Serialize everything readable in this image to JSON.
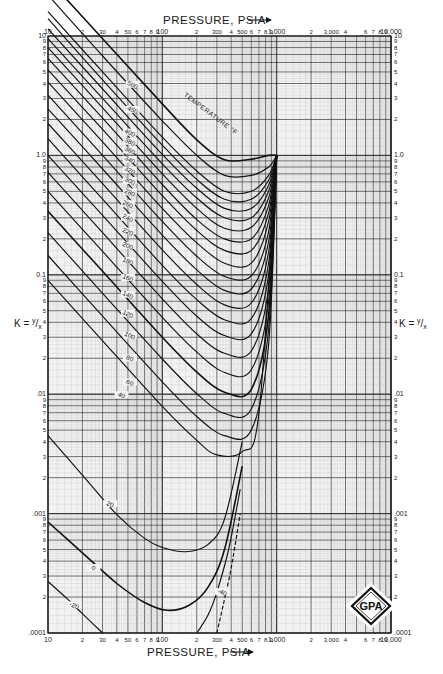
{
  "chart_data": {
    "type": "line",
    "title": "",
    "xlabel": "PRESSURE, PSIA",
    "ylabel": "K = y/x",
    "xscale": "log",
    "yscale": "log",
    "xlim": [
      10,
      10000
    ],
    "ylim": [
      0.0001,
      10
    ],
    "grid": true,
    "legend": "inline curve labels",
    "annotation": "TEMPERATURE °F",
    "logo": "GPA",
    "x_ticks_major": [
      "10",
      "100",
      "1,000",
      "10,000"
    ],
    "x_ticks_labeled": [
      {
        "v": 10,
        "t": "10"
      },
      {
        "v": 20,
        "t": "2"
      },
      {
        "v": 30,
        "t": "30"
      },
      {
        "v": 40,
        "t": "4"
      },
      {
        "v": 50,
        "t": "50"
      },
      {
        "v": 60,
        "t": "6"
      },
      {
        "v": 70,
        "t": "7"
      },
      {
        "v": 80,
        "t": "8"
      },
      {
        "v": 90,
        "t": "9"
      },
      {
        "v": 100,
        "t": "100"
      },
      {
        "v": 200,
        "t": "2"
      },
      {
        "v": 300,
        "t": "300"
      },
      {
        "v": 400,
        "t": "4"
      },
      {
        "v": 500,
        "t": "500"
      },
      {
        "v": 600,
        "t": "6"
      },
      {
        "v": 700,
        "t": "7"
      },
      {
        "v": 800,
        "t": "8"
      },
      {
        "v": 900,
        "t": "9"
      },
      {
        "v": 1000,
        "t": "1,000"
      },
      {
        "v": 2000,
        "t": "2"
      },
      {
        "v": 3000,
        "t": "3,000"
      },
      {
        "v": 4000,
        "t": "4"
      },
      {
        "v": 6000,
        "t": "6"
      },
      {
        "v": 7000,
        "t": "7"
      },
      {
        "v": 8000,
        "t": "8"
      },
      {
        "v": 9000,
        "t": "9"
      },
      {
        "v": 10000,
        "t": "10,000"
      }
    ],
    "y_ticks_labeled": [
      {
        "v": 10,
        "t": "10"
      },
      {
        "v": 1,
        "t": "1.0"
      },
      {
        "v": 0.1,
        "t": "0.1"
      },
      {
        "v": 0.01,
        "t": ".01"
      },
      {
        "v": 0.001,
        "t": ".001"
      },
      {
        "v": 0.0001,
        "t": ".0001"
      }
    ],
    "convergence_pressure_psia": 1000,
    "series": [
      {
        "name": "500",
        "points": [
          [
            10,
            30
          ],
          [
            30,
            9.5
          ],
          [
            100,
            2.7
          ],
          [
            200,
            1.35
          ],
          [
            350,
            0.92
          ],
          [
            600,
            0.93
          ],
          [
            850,
            1.0
          ],
          [
            1000,
            1.0
          ]
        ]
      },
      {
        "name": "450",
        "points": [
          [
            10,
            22
          ],
          [
            30,
            6.8
          ],
          [
            100,
            1.95
          ],
          [
            200,
            1.0
          ],
          [
            350,
            0.68
          ],
          [
            600,
            0.68
          ],
          [
            850,
            0.8
          ],
          [
            1000,
            1.0
          ]
        ]
      },
      {
        "name": "400",
        "points": [
          [
            10,
            16
          ],
          [
            30,
            5.0
          ],
          [
            100,
            1.42
          ],
          [
            200,
            0.74
          ],
          [
            350,
            0.5
          ],
          [
            600,
            0.5
          ],
          [
            850,
            0.68
          ],
          [
            1000,
            1.0
          ]
        ]
      },
      {
        "name": "380",
        "points": [
          [
            10,
            14
          ],
          [
            30,
            4.3
          ],
          [
            100,
            1.22
          ],
          [
            200,
            0.63
          ],
          [
            350,
            0.43
          ],
          [
            600,
            0.43
          ],
          [
            850,
            0.62
          ],
          [
            1000,
            1.0
          ]
        ]
      },
      {
        "name": "360",
        "points": [
          [
            10,
            11.5
          ],
          [
            30,
            3.6
          ],
          [
            100,
            1.02
          ],
          [
            200,
            0.53
          ],
          [
            350,
            0.36
          ],
          [
            600,
            0.36
          ],
          [
            850,
            0.56
          ],
          [
            1000,
            1.0
          ]
        ]
      },
      {
        "name": "340",
        "points": [
          [
            10,
            9.5
          ],
          [
            30,
            3.0
          ],
          [
            100,
            0.85
          ],
          [
            200,
            0.44
          ],
          [
            350,
            0.3
          ],
          [
            600,
            0.3
          ],
          [
            850,
            0.5
          ],
          [
            1000,
            1.0
          ]
        ]
      },
      {
        "name": "320",
        "points": [
          [
            10,
            8.0
          ],
          [
            30,
            2.5
          ],
          [
            100,
            0.7
          ],
          [
            200,
            0.36
          ],
          [
            350,
            0.245
          ],
          [
            600,
            0.25
          ],
          [
            850,
            0.44
          ],
          [
            1000,
            1.0
          ]
        ]
      },
      {
        "name": "300",
        "points": [
          [
            10,
            6.5
          ],
          [
            30,
            2.05
          ],
          [
            100,
            0.57
          ],
          [
            200,
            0.29
          ],
          [
            350,
            0.2
          ],
          [
            600,
            0.2
          ],
          [
            850,
            0.38
          ],
          [
            1000,
            1.0
          ]
        ]
      },
      {
        "name": "280",
        "points": [
          [
            10,
            5.2
          ],
          [
            30,
            1.65
          ],
          [
            100,
            0.46
          ],
          [
            200,
            0.235
          ],
          [
            350,
            0.16
          ],
          [
            600,
            0.16
          ],
          [
            850,
            0.33
          ],
          [
            1000,
            1.0
          ]
        ]
      },
      {
        "name": "260",
        "points": [
          [
            10,
            4.1
          ],
          [
            30,
            1.3
          ],
          [
            100,
            0.36
          ],
          [
            200,
            0.185
          ],
          [
            350,
            0.125
          ],
          [
            600,
            0.125
          ],
          [
            850,
            0.28
          ],
          [
            1000,
            1.0
          ]
        ]
      },
      {
        "name": "240",
        "points": [
          [
            10,
            3.2
          ],
          [
            30,
            1.0
          ],
          [
            100,
            0.28
          ],
          [
            200,
            0.143
          ],
          [
            350,
            0.097
          ],
          [
            600,
            0.098
          ],
          [
            850,
            0.23
          ],
          [
            1000,
            1.0
          ]
        ]
      },
      {
        "name": "220",
        "points": [
          [
            10,
            2.45
          ],
          [
            30,
            0.77
          ],
          [
            100,
            0.215
          ],
          [
            200,
            0.11
          ],
          [
            350,
            0.074
          ],
          [
            600,
            0.076
          ],
          [
            850,
            0.19
          ],
          [
            1000,
            1.0
          ]
        ]
      },
      {
        "name": "200",
        "points": [
          [
            10,
            1.85
          ],
          [
            30,
            0.58
          ],
          [
            100,
            0.162
          ],
          [
            200,
            0.083
          ],
          [
            350,
            0.056
          ],
          [
            600,
            0.058
          ],
          [
            850,
            0.155
          ],
          [
            1000,
            1.0
          ]
        ]
      },
      {
        "name": "180",
        "points": [
          [
            10,
            1.38
          ],
          [
            30,
            0.43
          ],
          [
            100,
            0.12
          ],
          [
            200,
            0.062
          ],
          [
            350,
            0.042
          ],
          [
            600,
            0.043
          ],
          [
            850,
            0.125
          ],
          [
            1000,
            1.0
          ]
        ]
      },
      {
        "name": "160",
        "points": [
          [
            10,
            1.0
          ],
          [
            30,
            0.315
          ],
          [
            100,
            0.088
          ],
          [
            200,
            0.045
          ],
          [
            350,
            0.031
          ],
          [
            600,
            0.032
          ],
          [
            850,
            0.1
          ],
          [
            1000,
            1.0
          ]
        ]
      },
      {
        "name": "140",
        "points": [
          [
            10,
            0.72
          ],
          [
            30,
            0.225
          ],
          [
            100,
            0.063
          ],
          [
            200,
            0.032
          ],
          [
            350,
            0.022
          ],
          [
            600,
            0.023
          ],
          [
            850,
            0.078
          ],
          [
            1000,
            1.0
          ]
        ]
      },
      {
        "name": "120",
        "points": [
          [
            10,
            0.5
          ],
          [
            30,
            0.157
          ],
          [
            100,
            0.044
          ],
          [
            200,
            0.0225
          ],
          [
            350,
            0.0152
          ],
          [
            600,
            0.016
          ],
          [
            850,
            0.06
          ],
          [
            1000,
            1.0
          ]
        ]
      },
      {
        "name": "100",
        "points": [
          [
            10,
            0.34
          ],
          [
            30,
            0.107
          ],
          [
            100,
            0.03
          ],
          [
            200,
            0.0153
          ],
          [
            350,
            0.0104
          ],
          [
            600,
            0.011
          ],
          [
            850,
            0.046
          ],
          [
            1000,
            1.0
          ]
        ]
      },
      {
        "name": "80",
        "points": [
          [
            10,
            0.225
          ],
          [
            30,
            0.07
          ],
          [
            100,
            0.0197
          ],
          [
            200,
            0.0101
          ],
          [
            350,
            0.0069
          ],
          [
            600,
            0.0075
          ],
          [
            850,
            0.035
          ],
          [
            1000,
            1.0
          ]
        ]
      },
      {
        "name": "60",
        "points": [
          [
            10,
            0.145
          ],
          [
            30,
            0.045
          ],
          [
            100,
            0.0127
          ],
          [
            200,
            0.0065
          ],
          [
            350,
            0.0045
          ],
          [
            600,
            0.005
          ],
          [
            850,
            0.026
          ],
          [
            1000,
            1.0
          ]
        ]
      },
      {
        "name": "40",
        "points": [
          [
            10,
            0.09
          ],
          [
            30,
            0.028
          ],
          [
            100,
            0.0079
          ],
          [
            200,
            0.0041
          ],
          [
            300,
            0.0031
          ],
          [
            500,
            0.0033
          ],
          [
            700,
            0.007
          ],
          [
            1000,
            1.0
          ]
        ]
      },
      {
        "name": "20",
        "points": [
          [
            10,
            0.0045
          ],
          [
            20,
            0.0021
          ],
          [
            40,
            0.00098
          ],
          [
            70,
            0.00062
          ],
          [
            100,
            0.00052
          ],
          [
            160,
            0.00048
          ],
          [
            250,
            0.00055
          ],
          [
            350,
            0.0009
          ],
          [
            500,
            0.004
          ]
        ]
      },
      {
        "name": "0",
        "points": [
          [
            10,
            0.00085
          ],
          [
            20,
            0.00047
          ],
          [
            40,
            0.00026
          ],
          [
            70,
            0.00018
          ],
          [
            110,
            0.000155
          ],
          [
            170,
            0.00017
          ],
          [
            250,
            0.00024
          ],
          [
            350,
            0.0005
          ],
          [
            500,
            0.0025
          ]
        ]
      },
      {
        "name": "-20",
        "points": [
          [
            10,
            0.00027
          ],
          [
            15,
            0.00019
          ],
          [
            20,
            0.000145
          ],
          [
            30,
            0.0001
          ]
        ]
      },
      {
        "name": "-40",
        "points": [
          [
            200,
            0.0001
          ],
          [
            250,
            0.00014
          ],
          [
            300,
            0.00022
          ],
          [
            380,
            0.0005
          ],
          [
            480,
            0.0016
          ]
        ]
      },
      {
        "name": "-40 (dashed)",
        "points": [
          [
            300,
            0.0001
          ],
          [
            340,
            0.00017
          ],
          [
            400,
            0.00035
          ],
          [
            480,
            0.001
          ]
        ]
      }
    ],
    "curve_label_positions": [
      {
        "t": "500",
        "P": 55,
        "K": 3.9
      },
      {
        "t": "450",
        "P": 55,
        "K": 2.4
      },
      {
        "t": "400",
        "P": 52,
        "K": 1.55
      },
      {
        "t": "380",
        "P": 52,
        "K": 1.3
      },
      {
        "t": "360",
        "P": 52,
        "K": 1.1
      },
      {
        "t": "340",
        "P": 52,
        "K": 0.92
      },
      {
        "t": "320",
        "P": 52,
        "K": 0.75
      },
      {
        "t": "300",
        "P": 52,
        "K": 0.61
      },
      {
        "t": "280",
        "P": 52,
        "K": 0.49
      },
      {
        "t": "260",
        "P": 50,
        "K": 0.39
      },
      {
        "t": "240",
        "P": 50,
        "K": 0.3
      },
      {
        "t": "220",
        "P": 50,
        "K": 0.23
      },
      {
        "t": "200",
        "P": 50,
        "K": 0.175
      },
      {
        "t": "180",
        "P": 50,
        "K": 0.13
      },
      {
        "t": "160",
        "P": 50,
        "K": 0.094
      },
      {
        "t": "140",
        "P": 50,
        "K": 0.068
      },
      {
        "t": "120",
        "P": 50,
        "K": 0.047
      },
      {
        "t": "100",
        "P": 52,
        "K": 0.031
      },
      {
        "t": "80",
        "P": 52,
        "K": 0.02
      },
      {
        "t": "60",
        "P": 52,
        "K": 0.0125
      },
      {
        "t": "40",
        "P": 44,
        "K": 0.0098
      },
      {
        "t": "20",
        "P": 35,
        "K": 0.0012
      },
      {
        "t": "0",
        "P": 25,
        "K": 0.00035
      },
      {
        "t": "-20",
        "P": 17,
        "K": 0.00017
      },
      {
        "t": "-40",
        "P": 335,
        "K": 0.00022
      }
    ]
  },
  "labels": {
    "top_axis_title": "PRESSURE, PSIA",
    "bottom_axis_title": "PRESSURE, PSIA",
    "left_axis_title": "K = y/x",
    "right_axis_title": "K = y/x",
    "annotation": "TEMPERATURE °F",
    "logo": "GPA"
  }
}
